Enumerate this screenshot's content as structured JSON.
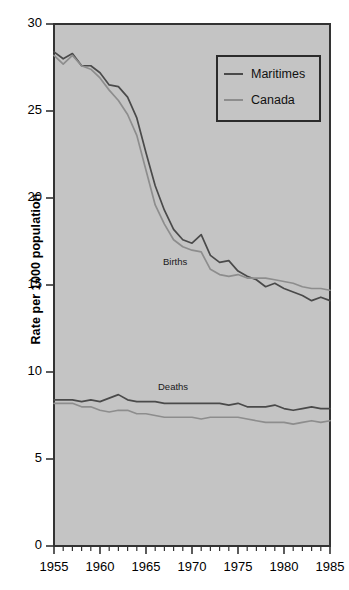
{
  "figure": {
    "background_color": "#ffffff",
    "plot_background_color": "#c4c4c4",
    "axis_color": "#333333",
    "top_artifact_text": "· · ·"
  },
  "axes": {
    "ylabel": "Rate per 1000 population",
    "ytick_labels": [
      "0",
      "5",
      "10",
      "15",
      "20",
      "25",
      "30"
    ],
    "xtick_labels": [
      "1955",
      "1960",
      "1965",
      "1970",
      "1975",
      "1980",
      "1985"
    ]
  },
  "legend": {
    "items": [
      {
        "label": "Maritimes",
        "color": "#4a4a4a"
      },
      {
        "label": "Canada",
        "color": "#8d8d8d"
      }
    ]
  },
  "annotations": [
    {
      "text": "Births",
      "x": 163,
      "y": 256
    },
    {
      "text": "Deaths",
      "x": 158,
      "y": 381
    }
  ],
  "chart_data": {
    "type": "line",
    "title": "",
    "xlabel": "",
    "ylabel": "Rate per 1000 population",
    "xlim": [
      1955,
      1985
    ],
    "ylim": [
      0,
      30
    ],
    "yticks": [
      0,
      5,
      10,
      15,
      20,
      25,
      30
    ],
    "xticks": [
      1955,
      1960,
      1965,
      1970,
      1975,
      1980,
      1985
    ],
    "xtick_minor_step": 1,
    "grid": false,
    "legend_position": "upper right",
    "x": [
      1955,
      1956,
      1957,
      1958,
      1959,
      1960,
      1961,
      1962,
      1963,
      1964,
      1965,
      1966,
      1967,
      1968,
      1969,
      1970,
      1971,
      1972,
      1973,
      1974,
      1975,
      1976,
      1977,
      1978,
      1979,
      1980,
      1981,
      1982,
      1983,
      1984,
      1985
    ],
    "series": [
      {
        "name": "Maritimes",
        "measure": "Births",
        "color": "#4a4a4a",
        "values": [
          28.4,
          28.0,
          28.3,
          27.6,
          27.6,
          27.2,
          26.5,
          26.4,
          25.8,
          24.6,
          22.6,
          20.7,
          19.3,
          18.2,
          17.6,
          17.4,
          17.9,
          16.7,
          16.3,
          16.4,
          15.8,
          15.5,
          15.3,
          14.9,
          15.1,
          14.8,
          14.6,
          14.4,
          14.1,
          14.3,
          14.1
        ]
      },
      {
        "name": "Canada",
        "measure": "Births",
        "color": "#8d8d8d",
        "values": [
          28.2,
          27.7,
          28.2,
          27.6,
          27.4,
          26.9,
          26.2,
          25.6,
          24.8,
          23.6,
          21.6,
          19.6,
          18.5,
          17.6,
          17.2,
          17.0,
          16.9,
          15.9,
          15.6,
          15.5,
          15.6,
          15.4,
          15.4,
          15.4,
          15.3,
          15.2,
          15.1,
          14.9,
          14.8,
          14.8,
          14.7
        ]
      },
      {
        "name": "Maritimes",
        "measure": "Deaths",
        "color": "#4a4a4a",
        "values": [
          8.4,
          8.4,
          8.4,
          8.3,
          8.4,
          8.3,
          8.5,
          8.7,
          8.4,
          8.3,
          8.3,
          8.3,
          8.2,
          8.2,
          8.2,
          8.2,
          8.2,
          8.2,
          8.2,
          8.1,
          8.2,
          8.0,
          8.0,
          8.0,
          8.1,
          7.9,
          7.8,
          7.9,
          8.0,
          7.9,
          7.9
        ]
      },
      {
        "name": "Canada",
        "measure": "Deaths",
        "color": "#8d8d8d",
        "values": [
          8.2,
          8.2,
          8.2,
          8.0,
          8.0,
          7.8,
          7.7,
          7.8,
          7.8,
          7.6,
          7.6,
          7.5,
          7.4,
          7.4,
          7.4,
          7.4,
          7.3,
          7.4,
          7.4,
          7.4,
          7.4,
          7.3,
          7.2,
          7.1,
          7.1,
          7.1,
          7.0,
          7.1,
          7.2,
          7.1,
          7.2
        ]
      }
    ]
  }
}
